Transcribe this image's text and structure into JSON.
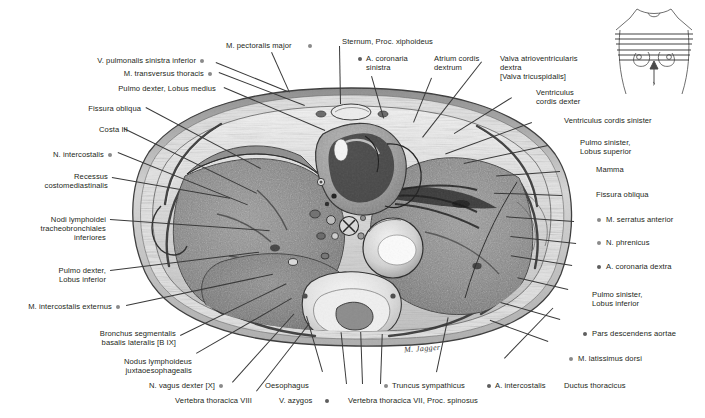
{
  "figure": {
    "signature": "M. Jagger",
    "inset": {
      "name": "torso-orientation-inset",
      "description": "anterior torso outline with transverse section planes and upward viewing-direction arrow"
    },
    "plate": {
      "name": "thorax-transverse-section",
      "description": "grayscale transverse (axial) anatomical section of the human thorax at the level of the xiphoid process"
    }
  },
  "labels_left": [
    {
      "text": "V. pulmonalis sinistra inferior",
      "dot": "after"
    },
    {
      "text": "M. transversus thoracis",
      "dot": "after"
    },
    {
      "text": "Pulmo dexter, Lobus medius",
      "dot": "none"
    },
    {
      "text": "Fissura obliqua",
      "dot": "none"
    },
    {
      "text": "Costa III",
      "dot": "none"
    },
    {
      "text": "N. intercostalis",
      "dot": "after"
    },
    {
      "text": "Recessus\ncostomediastinalis",
      "dot": "none"
    },
    {
      "text": "Nodi lymphoidei\ntracheobronchiales\ninferiores",
      "dot": "none"
    },
    {
      "text": "Pulmo dexter,\nLobus inferior",
      "dot": "none"
    },
    {
      "text": "M. intercostalis externus",
      "dot": "after"
    },
    {
      "text": "Bronchus segmentalis\nbasalis lateralis [B IX]",
      "dot": "none"
    },
    {
      "text": "Nodus lymphoideus\njuxtaoesophagealis",
      "dot": "none"
    },
    {
      "text": "N. vagus dexter [X]",
      "dot": "after"
    },
    {
      "text": "Vertebra thoracica VIII",
      "dot": "none"
    }
  ],
  "labels_top": [
    {
      "text": "M. pectoralis major",
      "dot": "after"
    },
    {
      "text": "Sternum, Proc. xiphoideus",
      "dot": "none"
    },
    {
      "text": "A. coronaria\nsinistra",
      "dot": "before"
    },
    {
      "text": "Atrium cordis\ndextrum",
      "dot": "none"
    },
    {
      "text": "Valva atrioventricularis\ndextra\n[Valva tricuspidalis]",
      "dot": "none"
    }
  ],
  "labels_right": [
    {
      "text": "Ventriculus\ncordis dexter",
      "dot": "none"
    },
    {
      "text": "Ventriculus cordis sinister",
      "dot": "none"
    },
    {
      "text": "Pulmo sinister,\nLobus superior",
      "dot": "none"
    },
    {
      "text": "Mamma",
      "dot": "none"
    },
    {
      "text": "Fissura obliqua",
      "dot": "none"
    },
    {
      "text": "M. serratus anterior",
      "dot": "before"
    },
    {
      "text": "N. phrenicus",
      "dot": "before"
    },
    {
      "text": "A. coronaria dextra",
      "dot": "before"
    },
    {
      "text": "Pulmo sinister,\nLobus inferior",
      "dot": "none"
    },
    {
      "text": "Pars descendens aortae",
      "dot": "before"
    },
    {
      "text": "M. latissimus dorsi",
      "dot": "before"
    }
  ],
  "labels_bottom": [
    {
      "text": "Oesophagus",
      "dot": "none"
    },
    {
      "text": "V. azygos",
      "dot": "after"
    },
    {
      "text": "Truncus sympathicus",
      "dot": "before"
    },
    {
      "text": "Vertebra thoracica VII, Proc. spinosus",
      "dot": "none"
    },
    {
      "text": "A. intercostalis",
      "dot": "before"
    },
    {
      "text": "Ductus thoracicus",
      "dot": "none"
    }
  ],
  "colors": {
    "text": "#231f20",
    "leader": "#3a3a3a",
    "dot": "#8a8a8a",
    "dot_dark": "#5e5e5e",
    "background": "#ffffff"
  }
}
